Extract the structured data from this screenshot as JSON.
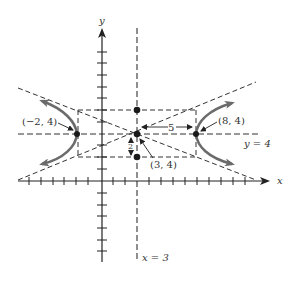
{
  "diagram": {
    "type": "hyperbola-graph",
    "axes": {
      "x_label": "x",
      "y_label": "y"
    },
    "center": {
      "label": "(3, 4)",
      "x": 3,
      "y": 4
    },
    "vertices": [
      {
        "label": "(−2, 4)",
        "x": -2,
        "y": 4
      },
      {
        "label": "(8, 4)",
        "x": 8,
        "y": 4
      }
    ],
    "co_vertices": [
      {
        "x": 3,
        "y": 6
      },
      {
        "x": 3,
        "y": 2
      }
    ],
    "lines": {
      "horizontal_axis_label": "y = 4",
      "vertical_axis_label": "x = 3"
    },
    "dimensions": {
      "semi_transverse_label": "5",
      "semi_conjugate_label": "2"
    },
    "asymptotes": "dashed lines through center (3, 4) with slopes ±2/5",
    "branches": [
      "left",
      "right"
    ],
    "colors": {
      "curve": "#6b6b6b",
      "lines": "#333333",
      "points": "#1a1a1a"
    }
  }
}
